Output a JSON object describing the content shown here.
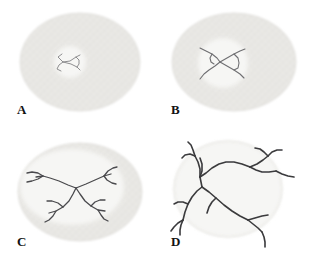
{
  "figure": {
    "width": 309,
    "height": 266,
    "background": "#ffffff",
    "layout": "2x2 grid of specimen panels"
  },
  "colors": {
    "background": "#ffffff",
    "disc_body": "#e8e7e4",
    "disc_body_edge": "#dddcd8",
    "disc_texture": "#dfdedb",
    "inner_region": "#f7f7f5",
    "crack_light": "#8d8d8f",
    "crack_mid": "#6f6f72",
    "crack_dark": "#3a3a3c",
    "label_text": "#121212"
  },
  "panels": [
    {
      "id": "a",
      "label": "A",
      "stage": "initial central flaw",
      "disc": {
        "cx": 80,
        "cy": 62,
        "rx": 60,
        "ry": 49
      },
      "inner": {
        "cx": 70,
        "cy": 62,
        "rx": 16,
        "ry": 16
      },
      "crack_color": "#8d8d8f",
      "crack_width": 1.0,
      "cracks": [
        "M 62 54 L 58 57 L 61 60 L 63 62",
        "M 63 62 L 59 65 L 57 69 L 61 71",
        "M 63 62 L 70 61 L 76 57 L 80 55",
        "M 63 62 L 71 64 L 77 67 L 80 70",
        "M 76 57 L 79 60 L 79 64 L 77 67"
      ]
    },
    {
      "id": "b",
      "label": "B",
      "stage": "crack spans inner region",
      "disc": {
        "cx": 80,
        "cy": 62,
        "rx": 62,
        "ry": 49
      },
      "inner": {
        "cx": 69,
        "cy": 63,
        "rx": 25,
        "ry": 25
      },
      "crack_color": "#6f6f72",
      "crack_width": 1.1,
      "cracks": [
        "M 46 48 L 52 51 L 58 54 L 63 58 L 66 62",
        "M 66 62 L 61 66 L 55 70 L 50 74 L 46 79",
        "M 66 62 L 73 58 L 80 54 L 86 51 L 91 49",
        "M 66 62 L 73 66 L 80 70 L 86 74 L 90 78",
        "M 80 54 L 84 58 L 85 63 L 84 68 L 80 70",
        "M 58 54 L 56 58 L 57 62 L 60 64"
      ]
    },
    {
      "id": "c",
      "label": "C",
      "stage": "branched network inside disc",
      "disc": {
        "cx": 80,
        "cy": 61,
        "rx": 62,
        "ry": 49
      },
      "inner": {
        "cx": 72,
        "cy": 56,
        "rx": 52,
        "ry": 38
      },
      "crack_color": "#4a4a4d",
      "crack_width": 1.3,
      "cracks": [
        "M 76 57 L 68 54 L 59 50 L 50 47 L 43 45 L 36 46",
        "M 43 45 L 38 42 L 32 41 L 27 42",
        "M 43 45 L 38 48 L 32 50 L 27 51",
        "M 76 57 L 86 53 L 95 49 L 104 45 L 111 43",
        "M 104 45 L 108 40 L 113 37 L 117 36",
        "M 104 45 L 107 49 L 112 52 L 116 53",
        "M 76 57 L 73 63 L 69 70 L 63 76 L 56 80 L 49 82",
        "M 63 76 L 58 72 L 52 70 L 47 70",
        "M 56 80 L 53 85 L 49 89 L 45 91",
        "M 76 57 L 80 63 L 85 70 L 91 75 L 98 79 L 105 80",
        "M 91 75 L 95 71 L 100 69 L 105 69",
        "M 98 79 L 101 84 L 104 88 L 108 90"
      ]
    },
    {
      "id": "d",
      "label": "D",
      "stage": "network extends beyond disc",
      "disc": {
        "cx": 74,
        "cy": 58,
        "rx": 54,
        "ry": 48
      },
      "inner": {
        "cx": 74,
        "cy": 58,
        "rx": 54,
        "ry": 48
      },
      "crack_color": "#3a3a3c",
      "crack_width": 1.6,
      "cracks": [
        "M 46 46 L 46 38 L 44 31 L 41 25",
        "M 41 25 L 36 23 L 31 24 L 28 27",
        "M 41 25 L 39 19 L 37 14 L 34 11",
        "M 46 46 L 48 40 L 48 33 L 46 27",
        "M 46 46 L 52 42 L 58 37 L 65 33 L 72 31 L 80 31 L 88 33 L 96 36",
        "M 96 36 L 103 33 L 109 29 L 114 25",
        "M 114 25 L 118 21 L 123 19 L 128 19",
        "M 114 25 L 110 21 L 106 18 L 101 17",
        "M 96 36 L 102 39 L 108 41 L 115 41 L 122 40",
        "M 122 40 L 128 43 L 134 45 L 140 46",
        "M 46 46 L 47 51 L 48 56",
        "M 48 56 L 43 60 L 38 66 L 34 73 L 31 81 L 29 89",
        "M 34 73 L 29 71 L 24 71 L 20 73",
        "M 29 89 L 24 92 L 20 96 L 17 100",
        "M 29 89 L 27 94 L 26 99 L 26 104",
        "M 48 56 L 55 61 L 62 67 L 70 74 L 78 80 L 86 85 L 94 89",
        "M 94 89 L 101 87 L 108 85 L 114 84",
        "M 94 89 L 99 93 L 104 97 L 108 101",
        "M 108 101 L 110 106 L 111 111 L 111 116",
        "M 62 67 L 58 71 L 55 76 L 53 82"
      ]
    }
  ]
}
